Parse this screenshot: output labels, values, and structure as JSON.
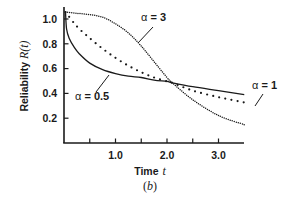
{
  "figure": {
    "caption_label": "(b)",
    "caption_letter": "b"
  },
  "chart_data": {
    "type": "line",
    "title": "",
    "xlabel": "Time t",
    "xlabel_text": "Time",
    "xlabel_var": "t",
    "ylabel": "Reliability R(t)",
    "ylabel_text": "Reliability ",
    "ylabel_var": "R(t)",
    "xlim": [
      0,
      3.5
    ],
    "ylim": [
      0,
      1.07
    ],
    "x_ticks": [
      0.5,
      1.0,
      1.5,
      2.0,
      2.5,
      3.0
    ],
    "x_tick_labels": [
      "1.0",
      "2.0",
      "3.0"
    ],
    "x_tick_label_values": [
      1.0,
      2.0,
      3.0
    ],
    "y_ticks": [
      0.2,
      0.4,
      0.6,
      0.8,
      1.0
    ],
    "y_tick_labels": [
      "0.2",
      "0.4",
      "0.6",
      "0.8",
      "1.0"
    ],
    "grid": false,
    "legend": "inline annotations",
    "series": [
      {
        "name": "α = 0.5",
        "alpha": 0.5,
        "style": "solid",
        "x": [
          0.0,
          0.05,
          0.1,
          0.2,
          0.3,
          0.5,
          0.75,
          1.0,
          1.25,
          1.5,
          1.75,
          2.0,
          2.1,
          2.5,
          3.0,
          3.5
        ],
        "values": [
          1.0,
          0.87,
          0.8,
          0.73,
          0.68,
          0.61,
          0.56,
          0.53,
          0.51,
          0.5,
          0.48,
          0.47,
          0.46,
          0.43,
          0.4,
          0.37
        ]
      },
      {
        "name": "α = 1",
        "alpha": 1,
        "style": "dotted-large",
        "x": [
          0.0,
          0.25,
          0.5,
          0.75,
          1.0,
          1.25,
          1.5,
          1.75,
          2.0,
          2.1,
          2.5,
          3.0,
          3.5
        ],
        "values": [
          1.0,
          0.89,
          0.8,
          0.72,
          0.65,
          0.59,
          0.54,
          0.5,
          0.47,
          0.46,
          0.4,
          0.35,
          0.31
        ]
      },
      {
        "name": "α = 3",
        "alpha": 3,
        "style": "dotted-fine",
        "x": [
          0.0,
          0.25,
          0.5,
          0.75,
          1.0,
          1.25,
          1.5,
          1.75,
          2.0,
          2.1,
          2.5,
          3.0,
          3.5
        ],
        "values": [
          1.0,
          0.99,
          0.98,
          0.96,
          0.91,
          0.84,
          0.74,
          0.62,
          0.5,
          0.46,
          0.33,
          0.21,
          0.14
        ]
      }
    ],
    "annotations": [
      {
        "text": "α = 3",
        "greek": "α",
        "eq": " = ",
        "num": "3"
      },
      {
        "text": "α = 1",
        "greek": "α",
        "eq": " = ",
        "num": "1"
      },
      {
        "text": "α = 0.5",
        "greek": "α",
        "eq": " = ",
        "num": "0.5"
      }
    ]
  }
}
